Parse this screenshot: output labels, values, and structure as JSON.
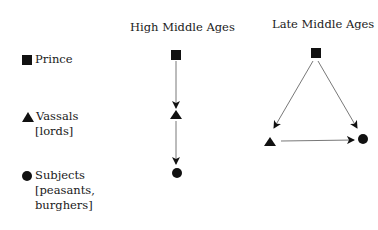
{
  "columns": {
    "high": {
      "title": "High Middle Ages"
    },
    "late": {
      "title": "Late Middle Ages"
    }
  },
  "legend": {
    "items": [
      {
        "symbol": "square",
        "label_line1": "Prince",
        "label_line2": "",
        "label_line3": ""
      },
      {
        "symbol": "triangle",
        "label_line1": "Vassals",
        "label_line2": "[lords]",
        "label_line3": ""
      },
      {
        "symbol": "circle",
        "label_line1": "Subjects",
        "label_line2": "[peasants,",
        "label_line3": "burghers]"
      }
    ]
  },
  "diagrams": {
    "high": {
      "edges": [
        [
          "Prince",
          "Vassals"
        ],
        [
          "Vassals",
          "Subjects"
        ]
      ]
    },
    "late": {
      "edges": [
        [
          "Prince",
          "Vassals"
        ],
        [
          "Prince",
          "Subjects"
        ],
        [
          "Vassals",
          "Subjects"
        ]
      ]
    }
  },
  "colors": {
    "ink": "#1a1a1a",
    "line": "#555555"
  }
}
